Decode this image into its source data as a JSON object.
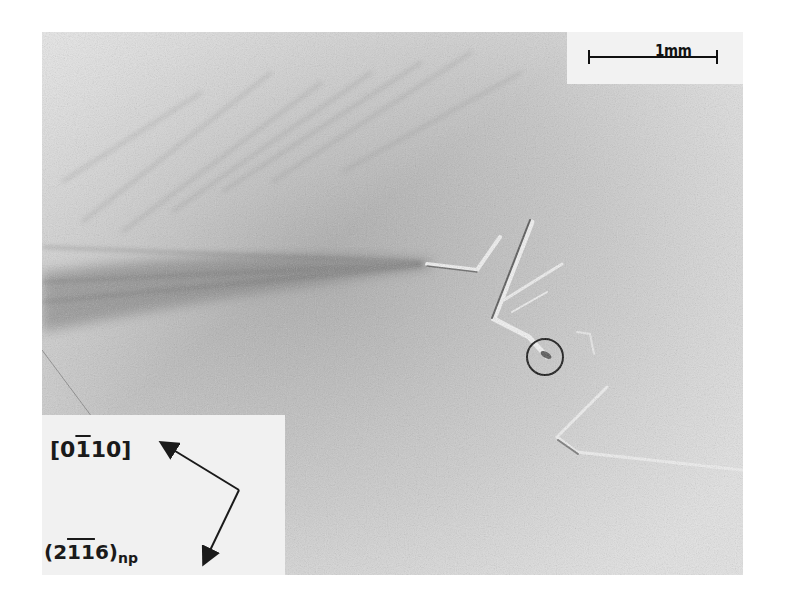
{
  "image": {
    "type": "grayscale optical micrograph",
    "description": "Crystal surface with bent slip/twin traces; one feature circled"
  },
  "scale_bar": {
    "label": "1mm"
  },
  "inset_labels": {
    "direction": "[0̄1̄10]",
    "direction_parts": {
      "open": "[",
      "d1": "0",
      "d2": "1",
      "d3": "1",
      "d4": "0",
      "close": "]"
    },
    "plane": "(2̄1̄1̄6)np",
    "plane_parts": {
      "open": "(",
      "d1": "2",
      "d2": "1",
      "d3": "1",
      "d4": "6",
      "close": ")",
      "subscript": "np"
    }
  },
  "annotations": {
    "circle": "marked feature near center-right"
  }
}
